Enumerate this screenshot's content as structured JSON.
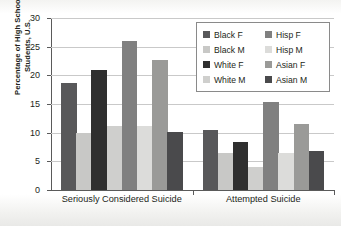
{
  "chart_data": {
    "type": "bar",
    "title": "",
    "xlabel": "",
    "ylabel": "Percentage of High School Students, U.S.",
    "ylabel_line1": "Percentage of High School",
    "ylabel_line2": "Students, U.S.",
    "ylim": [
      0,
      30
    ],
    "ytick_values": [
      0,
      5,
      10,
      15,
      20,
      25,
      30
    ],
    "ytick_labels": [
      "0",
      "5",
      "10",
      "15",
      "20",
      "25",
      "30"
    ],
    "grid": true,
    "legend_position": "top-right",
    "categories": [
      "Seriously Considered Suicide",
      "Attempted Suicide"
    ],
    "series": [
      {
        "name": "Black F",
        "color": "#58585a",
        "values": [
          18.7,
          10.5
        ]
      },
      {
        "name": "Black M",
        "color": "#c8c8c6",
        "values": [
          10.0,
          6.5
        ]
      },
      {
        "name": "White F",
        "color": "#2f2f2f",
        "values": [
          21.0,
          8.4
        ]
      },
      {
        "name": "White M",
        "color": "#cfcfcd",
        "values": [
          11.2,
          4.0
        ]
      },
      {
        "name": "Hisp F",
        "color": "#808080",
        "values": [
          26.0,
          15.4
        ]
      },
      {
        "name": "Hisp M",
        "color": "#dcdcda",
        "values": [
          11.2,
          6.5
        ]
      },
      {
        "name": "Asian F",
        "color": "#9a9a98",
        "values": [
          22.7,
          11.5
        ]
      },
      {
        "name": "Asian M",
        "color": "#4a4a4c",
        "values": [
          10.1,
          6.8
        ]
      }
    ],
    "legend_entries": [
      {
        "label": "Black F",
        "color": "#58585a"
      },
      {
        "label": "Hisp F",
        "color": "#808080"
      },
      {
        "label": "Black M",
        "color": "#c8c8c6"
      },
      {
        "label": "Hisp M",
        "color": "#dcdcda"
      },
      {
        "label": "White F",
        "color": "#2f2f2f"
      },
      {
        "label": "Asian F",
        "color": "#9a9a98"
      },
      {
        "label": "White M",
        "color": "#cfcfcd"
      },
      {
        "label": "Asian M",
        "color": "#4a4a4c"
      }
    ]
  }
}
